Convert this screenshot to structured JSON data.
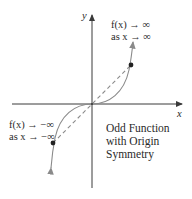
{
  "diagram": {
    "axes": {
      "x_label": "x",
      "y_label": "y"
    },
    "annotations": {
      "upper_right": {
        "line1": "f(x) → ∞",
        "line2": "as x → ∞"
      },
      "lower_left": {
        "line1": "f(x) → −∞",
        "line2": "as x → −∞"
      },
      "description": {
        "line1": "Odd Function",
        "line2": "with Origin",
        "line3": "Symmetry"
      }
    },
    "colors": {
      "axis": "#3a3a3a",
      "curve": "#8a8a8a",
      "dashed": "#8a8a8a",
      "point": "#222222"
    }
  }
}
